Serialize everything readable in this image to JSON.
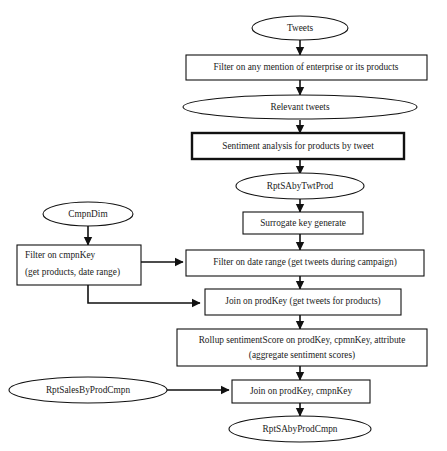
{
  "diagram": {
    "nodes": {
      "tweets": {
        "label": "Tweets",
        "shape": "ellipse"
      },
      "filter_mention": {
        "label": "Filter on any mention of enterprise or its products",
        "shape": "rectangle"
      },
      "relevant_tweets": {
        "label": "Relevant tweets",
        "shape": "ellipse"
      },
      "sentiment_analysis": {
        "label": "Sentiment analysis for products by tweet",
        "shape": "rectangle-bold"
      },
      "rpt_sa_by_twt_prod": {
        "label": "RptSAbyTwtProd",
        "shape": "ellipse"
      },
      "surrogate_key": {
        "label": "Surrogate key generate",
        "shape": "rectangle"
      },
      "cmpn_dim": {
        "label": "CmpnDim",
        "shape": "ellipse"
      },
      "filter_cmpnkey": {
        "shape": "rectangle",
        "line1": "Filter on cmpnKey",
        "line2": "(get products, date range)"
      },
      "filter_date_range": {
        "label": "Filter on date range (get tweets during campaign)",
        "shape": "rectangle"
      },
      "join_prodkey": {
        "label": "Join on prodKey (get tweets for products)",
        "shape": "rectangle"
      },
      "rollup": {
        "shape": "rectangle",
        "line1": "Rollup sentimentScore on prodKey, cpmnKey, attribute",
        "line2": "(aggregate sentiment scores)"
      },
      "rpt_sales_by_prod_cmpn": {
        "label": "RptSalesByProdCmpn",
        "shape": "ellipse"
      },
      "join_prodkey_cmpnkey": {
        "label": "Join on prodKey, cmpnKey",
        "shape": "rectangle"
      },
      "rpt_sa_by_prod_cmpn": {
        "label": "RptSAbyProdCmpn",
        "shape": "ellipse"
      }
    },
    "edges": [
      {
        "from": "tweets",
        "to": "filter_mention"
      },
      {
        "from": "filter_mention",
        "to": "relevant_tweets"
      },
      {
        "from": "relevant_tweets",
        "to": "sentiment_analysis"
      },
      {
        "from": "sentiment_analysis",
        "to": "rpt_sa_by_twt_prod"
      },
      {
        "from": "rpt_sa_by_twt_prod",
        "to": "surrogate_key"
      },
      {
        "from": "surrogate_key",
        "to": "filter_date_range"
      },
      {
        "from": "cmpn_dim",
        "to": "filter_cmpnkey"
      },
      {
        "from": "filter_cmpnkey",
        "to": "filter_date_range"
      },
      {
        "from": "filter_cmpnkey",
        "to": "join_prodkey"
      },
      {
        "from": "filter_date_range",
        "to": "join_prodkey"
      },
      {
        "from": "join_prodkey",
        "to": "rollup"
      },
      {
        "from": "rollup",
        "to": "join_prodkey_cmpnkey"
      },
      {
        "from": "rpt_sales_by_prod_cmpn",
        "to": "join_prodkey_cmpnkey"
      },
      {
        "from": "join_prodkey_cmpnkey",
        "to": "rpt_sa_by_prod_cmpn"
      }
    ],
    "colors": {
      "stroke": "#111111",
      "text": "#1a1a1a",
      "background": "#ffffff"
    }
  }
}
